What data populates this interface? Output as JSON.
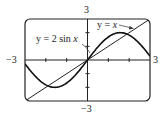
{
  "chart_data": {
    "type": "line",
    "title": "",
    "xlabel": "",
    "ylabel": "",
    "xlim": [
      -3,
      3
    ],
    "ylim": [
      -3,
      3
    ],
    "grid": false,
    "legend": "none (inline annotations)",
    "tick_labels": {
      "x_left": "−3",
      "x_right": "3",
      "y_top": "3",
      "y_bottom": "−3"
    },
    "x_ticks": [
      -3,
      -2,
      -1,
      0,
      1,
      2,
      3
    ],
    "y_ticks": [
      -3,
      -2,
      -1,
      0,
      1,
      2,
      3
    ],
    "series": [
      {
        "name": "y = 2 sin x",
        "expression": "2*sin(x)",
        "x": [
          -3,
          -2.5,
          -2,
          -1.5,
          -1,
          -0.5,
          0,
          0.5,
          1,
          1.5,
          2,
          2.5,
          3
        ],
        "y": [
          -0.28,
          -1.2,
          -1.82,
          -2.0,
          -1.68,
          -0.96,
          0,
          0.96,
          1.68,
          2.0,
          1.82,
          1.2,
          0.28
        ]
      },
      {
        "name": "y = x",
        "expression": "x",
        "x": [
          -3,
          3
        ],
        "y": [
          -3,
          3
        ]
      }
    ],
    "annotations": [
      {
        "text_prefix": "y = 2 sin ",
        "text_var": "x",
        "points_to": "y = 2 sin x curve near (0.3, 0.6)"
      },
      {
        "text_prefix": "y = ",
        "text_var": "x",
        "points_to": "y = x line near (2.2, 2.2)"
      }
    ],
    "intersections": [
      [
        -1.9,
        -1.9
      ],
      [
        0,
        0
      ],
      [
        1.9,
        1.9
      ]
    ]
  }
}
